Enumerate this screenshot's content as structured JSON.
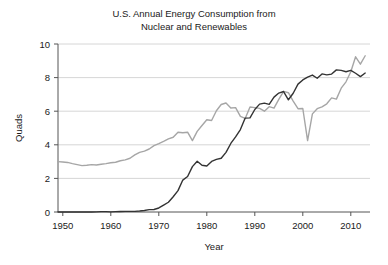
{
  "chart_data": {
    "type": "line",
    "title": "U.S. Annual Energy Consumption from\nNuclear and Renewables",
    "xlabel": "Year",
    "ylabel": "Quads",
    "xlim": [
      1949,
      2014
    ],
    "ylim": [
      0,
      10
    ],
    "xticks": [
      1950,
      1960,
      1970,
      1980,
      1990,
      2000,
      2010
    ],
    "yticks": [
      0,
      2,
      4,
      6,
      8,
      10
    ],
    "xtick_labels": [
      "1950",
      "1960",
      "1970",
      "1980",
      "1990",
      "2000",
      "2010"
    ],
    "ytick_labels": [
      "0",
      "2",
      "4",
      "6",
      "8",
      "10"
    ],
    "grid": "horizontal",
    "legend": "none",
    "colors": {
      "renewables_line": "#a6a6a6",
      "nuclear_line": "#333333",
      "gridline": "#cccccc",
      "axis": "#555555",
      "text": "#1a1a1a",
      "background": "#ffffff"
    },
    "x": [
      1949,
      1950,
      1951,
      1952,
      1953,
      1954,
      1955,
      1956,
      1957,
      1958,
      1959,
      1960,
      1961,
      1962,
      1963,
      1964,
      1965,
      1966,
      1967,
      1968,
      1969,
      1970,
      1971,
      1972,
      1973,
      1974,
      1975,
      1976,
      1977,
      1978,
      1979,
      1980,
      1981,
      1982,
      1983,
      1984,
      1985,
      1986,
      1987,
      1988,
      1989,
      1990,
      1991,
      1992,
      1993,
      1994,
      1995,
      1996,
      1997,
      1998,
      1999,
      2000,
      2001,
      2002,
      2003,
      2004,
      2005,
      2006,
      2007,
      2008,
      2009,
      2010,
      2011,
      2012,
      2013
    ],
    "series": [
      {
        "name": "Renewables",
        "color": "#a6a6a6",
        "values": [
          3.0,
          2.98,
          2.95,
          2.88,
          2.82,
          2.76,
          2.78,
          2.82,
          2.8,
          2.84,
          2.88,
          2.93,
          2.96,
          3.05,
          3.1,
          3.2,
          3.4,
          3.55,
          3.62,
          3.75,
          3.95,
          4.07,
          4.2,
          4.35,
          4.45,
          4.75,
          4.72,
          4.75,
          4.25,
          4.8,
          5.15,
          5.49,
          5.45,
          6.03,
          6.4,
          6.49,
          6.19,
          6.21,
          5.69,
          5.57,
          6.25,
          6.21,
          6.17,
          6.0,
          6.27,
          6.18,
          6.7,
          7.18,
          7.1,
          6.6,
          6.15,
          6.16,
          4.25,
          5.84,
          6.15,
          6.26,
          6.44,
          6.79,
          6.72,
          7.37,
          7.75,
          8.35,
          9.24,
          8.8,
          9.3
        ]
      },
      {
        "name": "Nuclear",
        "color": "#333333",
        "values": [
          0.0,
          0.0,
          0.0,
          0.0,
          0.0,
          0.0,
          0.0,
          0.0,
          0.01,
          0.02,
          0.02,
          0.01,
          0.02,
          0.03,
          0.04,
          0.04,
          0.04,
          0.06,
          0.09,
          0.14,
          0.15,
          0.24,
          0.41,
          0.58,
          0.91,
          1.27,
          1.9,
          2.11,
          2.7,
          3.02,
          2.78,
          2.74,
          3.01,
          3.13,
          3.2,
          3.55,
          4.08,
          4.47,
          4.91,
          5.59,
          5.6,
          6.1,
          6.42,
          6.48,
          6.41,
          6.84,
          7.08,
          7.17,
          6.68,
          7.07,
          7.61,
          7.86,
          8.03,
          8.15,
          7.96,
          8.22,
          8.16,
          8.21,
          8.46,
          8.43,
          8.35,
          8.43,
          8.26,
          8.06,
          8.27
        ]
      }
    ]
  }
}
